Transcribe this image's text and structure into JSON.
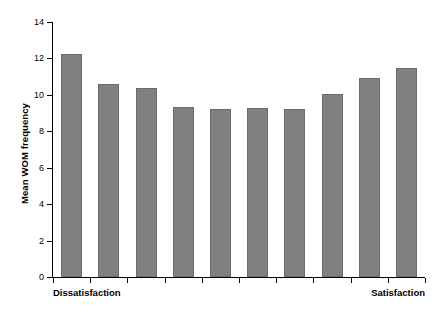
{
  "chart_data": {
    "type": "bar",
    "title": "",
    "subtitle": "",
    "xlabel": "",
    "ylabel": "Mean WOM frequency",
    "categories": [
      "1",
      "2",
      "3",
      "4",
      "5",
      "6",
      "7",
      "8",
      "9",
      "10"
    ],
    "values": [
      12.25,
      10.6,
      10.4,
      9.35,
      9.2,
      9.3,
      9.2,
      10.05,
      10.9,
      11.45
    ],
    "series": [
      {
        "name": "Mean WOM frequency",
        "values": [
          12.25,
          10.6,
          10.4,
          9.35,
          9.2,
          9.3,
          9.2,
          10.05,
          10.9,
          11.45
        ]
      }
    ],
    "ylim": [
      0,
      14
    ],
    "yticks": [
      0,
      2,
      4,
      6,
      8,
      10,
      12,
      14
    ],
    "ytick_labels": [
      "0",
      "2",
      "4",
      "6",
      "8",
      "10",
      "12",
      "14"
    ],
    "x_axis_endpoint_labels": {
      "left": "Dissatisfaction",
      "right": "Satisfaction"
    },
    "grid": false,
    "legend": null,
    "legend_position": "none",
    "bar_color": "#808080",
    "bar_edge_color": "#6b6b6b",
    "axis_color": "#000000",
    "background_color": "#ffffff"
  }
}
